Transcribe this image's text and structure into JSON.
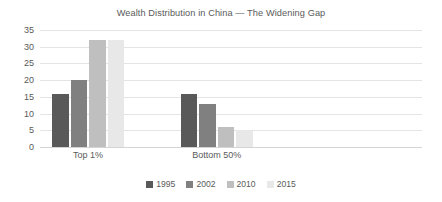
{
  "chart_data": {
    "type": "bar",
    "title": "Wealth Distribution in China — The Widening Gap",
    "xlabel": "",
    "ylabel": "",
    "categories": [
      "Top 1%",
      "Bottom 50%"
    ],
    "series": [
      {
        "name": "1995",
        "values": [
          16,
          16
        ],
        "color": "#595959"
      },
      {
        "name": "2002",
        "values": [
          20,
          13
        ],
        "color": "#808080"
      },
      {
        "name": "2010",
        "values": [
          32,
          6
        ],
        "color": "#bfbfbf"
      },
      {
        "name": "2015",
        "values": [
          32,
          5
        ],
        "color": "#e8e8e8"
      }
    ],
    "ylim": [
      0,
      35
    ],
    "yticks": [
      0,
      5,
      10,
      15,
      20,
      25,
      30,
      35
    ],
    "ytick_labels": [
      "0",
      "5",
      "10",
      "15",
      "20",
      "25",
      "30",
      "35"
    ],
    "grid": true,
    "legend_position": "bottom"
  }
}
